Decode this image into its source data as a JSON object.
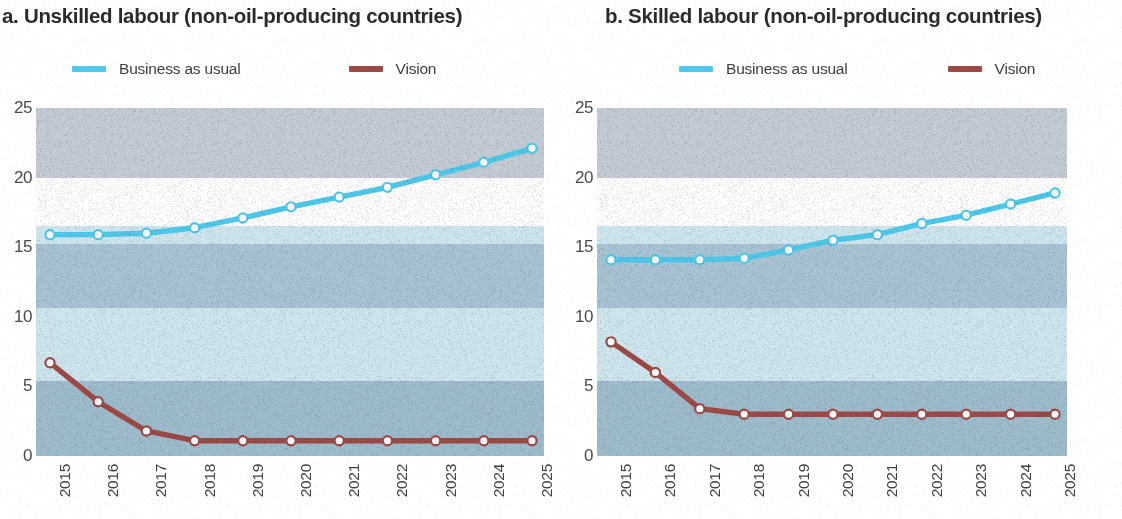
{
  "panels": [
    {
      "title": "a. Unskilled labour (non-oil-producing countries)",
      "legend": [
        {
          "label": "Business as usual",
          "color": "#4fc9ea"
        },
        {
          "label": "Vision",
          "color": "#9d4a47"
        }
      ],
      "chart_key": 0
    },
    {
      "title": "b. Skilled labour (non-oil-producing countries)",
      "legend": [
        {
          "label": "Business as usual",
          "color": "#4fc9ea"
        },
        {
          "label": "Vision",
          "color": "#9d4a47"
        }
      ],
      "chart_key": 1
    }
  ],
  "chart_data": [
    {
      "type": "line",
      "title": "a. Unskilled labour (non-oil-producing countries)",
      "xlabel": "",
      "ylabel": "",
      "categories": [
        "2015",
        "2016",
        "2017",
        "2018",
        "2019",
        "2020",
        "2021",
        "2022",
        "2023",
        "2024",
        "2025"
      ],
      "yticks": [
        0,
        5,
        10,
        15,
        20,
        25
      ],
      "ylim": [
        0,
        25
      ],
      "grid": false,
      "legend_position": "top",
      "series": [
        {
          "name": "Business as usual",
          "color": "#4fc9ea",
          "values": [
            15.9,
            15.9,
            16.0,
            16.4,
            17.1,
            17.9,
            18.6,
            19.3,
            20.2,
            21.1,
            22.1
          ]
        },
        {
          "name": "Vision",
          "color": "#9d4a47",
          "values": [
            6.7,
            3.9,
            1.8,
            1.1,
            1.1,
            1.1,
            1.1,
            1.1,
            1.1,
            1.1,
            1.1
          ]
        }
      ]
    },
    {
      "type": "line",
      "title": "b. Skilled labour (non-oil-producing countries)",
      "xlabel": "",
      "ylabel": "",
      "categories": [
        "2015",
        "2016",
        "2017",
        "2018",
        "2019",
        "2020",
        "2021",
        "2022",
        "2023",
        "2024",
        "2025"
      ],
      "yticks": [
        0,
        5,
        10,
        15,
        20,
        25
      ],
      "ylim": [
        0,
        25
      ],
      "grid": false,
      "legend_position": "top",
      "series": [
        {
          "name": "Business as usual",
          "color": "#4fc9ea",
          "values": [
            14.1,
            14.1,
            14.1,
            14.2,
            14.8,
            15.5,
            15.9,
            16.7,
            17.3,
            18.1,
            18.9
          ]
        },
        {
          "name": "Vision",
          "color": "#9d4a47",
          "values": [
            8.2,
            6.0,
            3.4,
            3.0,
            3.0,
            3.0,
            3.0,
            3.0,
            3.0,
            3.0,
            3.0
          ]
        }
      ]
    }
  ],
  "style": {
    "band_colors": [
      "#c4ccd6",
      "#ffffff",
      "#cfe6ef",
      "#a9c4d4",
      "#cfe6ef",
      "#9fbccd"
    ],
    "marker_fill": "#ffffff",
    "axis_text": "#4a4a4a"
  }
}
